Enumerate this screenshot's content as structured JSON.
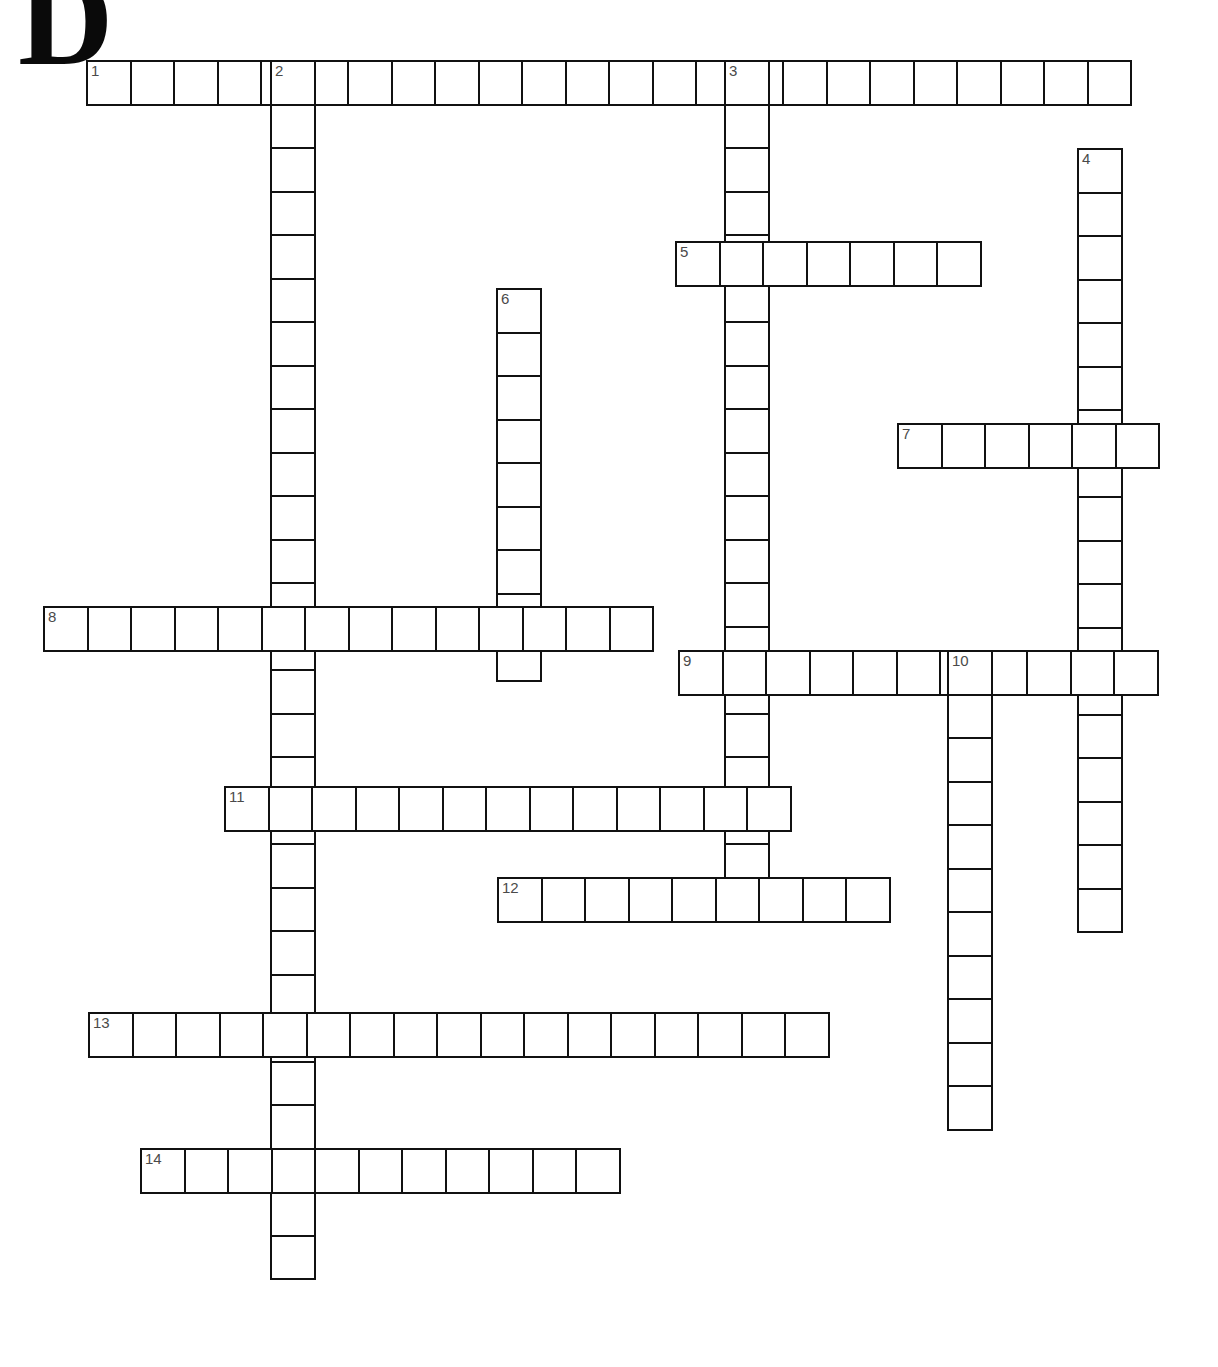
{
  "page": {
    "dropcap_letter": "D",
    "background_color": "#ffffff",
    "grid_line_color": "#111111",
    "cell_fill_color": "#ffffff",
    "clue_number_color": "#4a4a4a",
    "cell_size_px": 45.5
  },
  "entries": [
    {
      "number": "1",
      "direction": "across",
      "length": 24,
      "x": 86,
      "y": 60,
      "letters": []
    },
    {
      "number": "2",
      "direction": "down",
      "length": 28,
      "x": 270,
      "y": 60,
      "letters": []
    },
    {
      "number": "3",
      "direction": "down",
      "length": 19,
      "x": 724,
      "y": 60,
      "letters": []
    },
    {
      "number": "4",
      "direction": "down",
      "length": 18,
      "x": 1077,
      "y": 148,
      "letters": []
    },
    {
      "number": "5",
      "direction": "across",
      "length": 7,
      "x": 675,
      "y": 241,
      "letters": []
    },
    {
      "number": "6",
      "direction": "down",
      "length": 9,
      "x": 496,
      "y": 288,
      "letters": []
    },
    {
      "number": "7",
      "direction": "across",
      "length": 6,
      "x": 897,
      "y": 423,
      "letters": []
    },
    {
      "number": "8",
      "direction": "across",
      "length": 14,
      "x": 43,
      "y": 606,
      "letters": []
    },
    {
      "number": "9",
      "direction": "across",
      "length": 11,
      "x": 678,
      "y": 650,
      "letters": []
    },
    {
      "number": "10",
      "direction": "down",
      "length": 11,
      "x": 947,
      "y": 650,
      "letters": []
    },
    {
      "number": "11",
      "direction": "across",
      "length": 13,
      "x": 224,
      "y": 786,
      "letters": []
    },
    {
      "number": "12",
      "direction": "across",
      "length": 9,
      "x": 497,
      "y": 877,
      "letters": []
    },
    {
      "number": "13",
      "direction": "across",
      "length": 17,
      "x": 88,
      "y": 1012,
      "letters": []
    },
    {
      "number": "14",
      "direction": "across",
      "length": 11,
      "x": 140,
      "y": 1148,
      "letters": []
    }
  ]
}
